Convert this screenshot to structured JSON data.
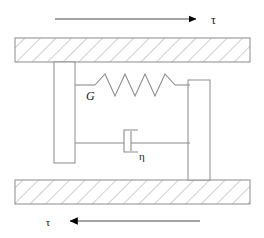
{
  "diagram": {
    "type": "mechanical-schematic",
    "canvas": {
      "width": 264,
      "height": 238
    },
    "colors": {
      "stroke": "#808080",
      "hatch": "#a0a0a0",
      "arrow": "#000000",
      "text": "#1a1a1a",
      "fill": "#ffffff",
      "background": "#ffffff"
    },
    "labels": {
      "shear_stress_top": "τ",
      "shear_stress_bottom": "τ",
      "spring_modulus": "G",
      "dashpot_viscosity": "η"
    },
    "elements": {
      "top_plate": {
        "name": "top-fixed-plate",
        "x": 15,
        "y": 38,
        "width": 235,
        "height": 24,
        "hatched": true
      },
      "bottom_plate": {
        "name": "bottom-fixed-plate",
        "x": 15,
        "y": 180,
        "width": 235,
        "height": 24,
        "hatched": true
      },
      "left_block": {
        "name": "left-vertical-block",
        "x": 54,
        "y": 62,
        "width": 21,
        "height": 101
      },
      "right_block": {
        "name": "right-vertical-block",
        "x": 188,
        "y": 80,
        "width": 22,
        "height": 100
      },
      "spring": {
        "name": "spring-element",
        "y": 85,
        "lead_in_start_x": 75,
        "zigzag_start_x": 95,
        "zigzag_end_x": 175,
        "lead_out_end_x": 190,
        "peaks": 4,
        "amplitude": 11
      },
      "dashpot": {
        "name": "dashpot-element",
        "y": 143,
        "left_lead_start_x": 75,
        "right_lead_end_x": 190,
        "cylinder_x": 124,
        "cylinder_y": 130,
        "cylinder_width": 14,
        "cylinder_height": 22,
        "piston_x": 131
      },
      "top_arrow": {
        "name": "top-shear-arrow",
        "direction": "right",
        "y": 19,
        "start_x": 55,
        "tip_x": 204,
        "label_x": 211,
        "label_y": 23
      },
      "bottom_arrow": {
        "name": "bottom-shear-arrow",
        "direction": "left",
        "y": 221,
        "start_x": 200,
        "tip_x": 62,
        "label_x": 48,
        "label_y": 225
      }
    },
    "label_positions": {
      "spring_modulus": {
        "x": 86,
        "y": 99
      },
      "dashpot_viscosity": {
        "x": 140,
        "y": 159
      }
    }
  }
}
